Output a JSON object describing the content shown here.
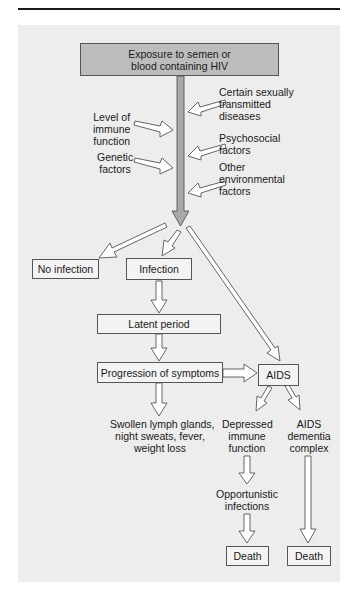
{
  "header": {
    "line1": "Exposure to semen or",
    "line2": "blood containing HIV"
  },
  "factors": {
    "left": [
      {
        "lines": [
          "Level of",
          "immune",
          "function"
        ]
      },
      {
        "lines": [
          "Genetic",
          "factors"
        ]
      }
    ],
    "right": [
      {
        "lines": [
          "Certain sexually",
          "transmitted",
          "diseases"
        ]
      },
      {
        "lines": [
          "Psychosocial",
          "factors"
        ]
      },
      {
        "lines": [
          "Other",
          "environmental",
          "factors"
        ]
      }
    ]
  },
  "nodes": {
    "no_infection": "No infection",
    "infection": "Infection",
    "latent_period": "Latent period",
    "progression": "Progression of symptoms",
    "aids": "AIDS",
    "symptoms": [
      "Swollen lymph glands,",
      "night sweats, fever,",
      "weight loss"
    ],
    "depressed": [
      "Depressed",
      "immune",
      "function"
    ],
    "dementia": [
      "AIDS",
      "dementia",
      "complex"
    ],
    "opportunistic": [
      "Opportunistic",
      "infections"
    ],
    "death_left": "Death",
    "death_right": "Death"
  },
  "colors": {
    "panel": "#ededed",
    "header_box": "#bdbdbd",
    "main_arrow": "#a9a9a9",
    "stroke": "#555555"
  }
}
